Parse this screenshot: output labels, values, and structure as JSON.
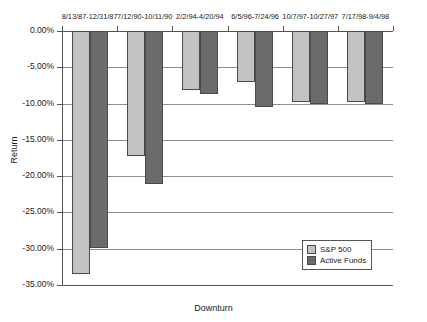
{
  "chart_data": {
    "type": "bar",
    "title": "",
    "xlabel": "Downturn",
    "ylabel": "Return",
    "categories": [
      "8/13/87-12/31/87",
      "7/12/90-10/11/90",
      "2/2/94-4/20/94",
      "6/5/96-7/24/96",
      "10/7/97-10/27/97",
      "7/17/98-9/4/98"
    ],
    "series": [
      {
        "name": "S&P 500",
        "color": "#c2c2c2",
        "values": [
          -33.5,
          -17.2,
          -8.1,
          -7.0,
          -9.8,
          -9.8
        ]
      },
      {
        "name": "Active Funds",
        "color": "#6b6b6b",
        "values": [
          -29.9,
          -21.1,
          -8.7,
          -10.5,
          -10.0,
          -10.0
        ]
      }
    ],
    "ylim": [
      -35,
      0
    ],
    "ytick_values": [
      0,
      -5,
      -10,
      -15,
      -20,
      -25,
      -30,
      -35
    ],
    "ytick_labels": [
      "0.00%",
      "-5.00%",
      "-10.00%",
      "-15.00%",
      "-20.00%",
      "-25.00%",
      "-30.00%",
      "-35.00%"
    ],
    "grid": true,
    "legend_position": "inside-bottom-right",
    "category_axis_position": "top"
  },
  "legend": {
    "items": [
      {
        "label": "S&P 500"
      },
      {
        "label": "Active Funds"
      }
    ]
  }
}
